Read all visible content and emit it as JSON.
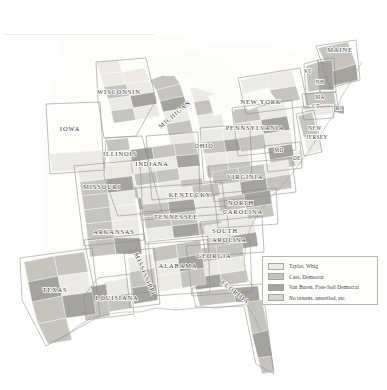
{
  "map": {
    "title": "1848 United States presidential election by county",
    "legend": {
      "items": [
        {
          "label": "Taylor, Whig",
          "color": "#eceae5"
        },
        {
          "label": "Cass, Democrat",
          "color": "#c6c4bf"
        },
        {
          "label": "Van Buren, Free-Soil Democrat",
          "color": "#a5a39e"
        },
        {
          "label": "No returns, unsettled, etc.",
          "color": "#d8d6d1"
        }
      ]
    },
    "state_labels": [
      {
        "name": "WISCONSIN",
        "x": 119,
        "y": 94,
        "size": "lbl",
        "rotate": 0
      },
      {
        "name": "IOWA",
        "x": 70,
        "y": 131,
        "size": "lbl",
        "rotate": 0
      },
      {
        "name": "ILLINOIS",
        "x": 120,
        "y": 156,
        "size": "lbl",
        "rotate": 0
      },
      {
        "name": "MICHIGAN",
        "x": 176,
        "y": 116,
        "size": "lbl",
        "rotate": -40
      },
      {
        "name": "INDIANA",
        "x": 152,
        "y": 166,
        "size": "lbl",
        "rotate": 0
      },
      {
        "name": "OHIO",
        "x": 204,
        "y": 148,
        "size": "lbl",
        "rotate": 0
      },
      {
        "name": "PENNSYLVANIA",
        "x": 255,
        "y": 130,
        "size": "lbl",
        "rotate": 0
      },
      {
        "name": "NEW YORK",
        "x": 261,
        "y": 104,
        "size": "lbl",
        "rotate": 0
      },
      {
        "name": "MAINE",
        "x": 340,
        "y": 52,
        "size": "lbl",
        "rotate": 0
      },
      {
        "name": "VT",
        "x": 308,
        "y": 73,
        "size": "lbl-sm",
        "rotate": 0
      },
      {
        "name": "NH",
        "x": 320,
        "y": 84,
        "size": "lbl-sm",
        "rotate": 0
      },
      {
        "name": "MA",
        "x": 320,
        "y": 99,
        "size": "lbl-sm",
        "rotate": 0
      },
      {
        "name": "CT",
        "x": 316,
        "y": 108,
        "size": "lbl-sm",
        "rotate": 0
      },
      {
        "name": "RI",
        "x": 339,
        "y": 110,
        "size": "lbl-sm",
        "rotate": 0
      },
      {
        "name": "NEW",
        "x": 315,
        "y": 130,
        "size": "lbl-sm",
        "rotate": 0
      },
      {
        "name": "JERSEY",
        "x": 317,
        "y": 139,
        "size": "lbl-sm",
        "rotate": 0
      },
      {
        "name": "MD",
        "x": 279,
        "y": 152,
        "size": "lbl-sm",
        "rotate": 0
      },
      {
        "name": "DE",
        "x": 297,
        "y": 160,
        "size": "lbl-sm",
        "rotate": 0
      },
      {
        "name": "VIRGINIA",
        "x": 245,
        "y": 179,
        "size": "lbl",
        "rotate": 0
      },
      {
        "name": "MISSOURI",
        "x": 102,
        "y": 189,
        "size": "lbl",
        "rotate": 0
      },
      {
        "name": "KENTUCKY",
        "x": 190,
        "y": 197,
        "size": "lbl",
        "rotate": 0
      },
      {
        "name": "TENNESSEE",
        "x": 176,
        "y": 219,
        "size": "lbl",
        "rotate": 0
      },
      {
        "name": "ARKANSAS",
        "x": 114,
        "y": 234,
        "size": "lbl",
        "rotate": 0
      },
      {
        "name": "NORTH",
        "x": 241,
        "y": 205,
        "size": "lbl",
        "rotate": 0
      },
      {
        "name": "CAROLINA",
        "x": 243,
        "y": 214,
        "size": "lbl",
        "rotate": 0
      },
      {
        "name": "SOUTH",
        "x": 225,
        "y": 233,
        "size": "lbl",
        "rotate": 0
      },
      {
        "name": "CAROLINA",
        "x": 227,
        "y": 242,
        "size": "lbl",
        "rotate": 0
      },
      {
        "name": "GEORGIA",
        "x": 214,
        "y": 258,
        "size": "lbl",
        "rotate": 0
      },
      {
        "name": "ALABAMA",
        "x": 178,
        "y": 268,
        "size": "lbl",
        "rotate": 0
      },
      {
        "name": "MISSISSIPPI",
        "x": 143,
        "y": 275,
        "size": "lbl",
        "rotate": 67
      },
      {
        "name": "LOUISIANA",
        "x": 117,
        "y": 300,
        "size": "lbl",
        "rotate": 0
      },
      {
        "name": "TEXAS",
        "x": 55,
        "y": 292,
        "size": "lbl",
        "rotate": 0
      },
      {
        "name": "FLORIDA",
        "x": 234,
        "y": 294,
        "size": "lbl",
        "rotate": 38
      }
    ]
  },
  "chart_data": {
    "type": "map",
    "projection": "albers-like",
    "legend_position": "bottom-right",
    "categories": [
      "Taylor, Whig",
      "Cass, Democrat",
      "Van Buren, Free-Soil Democrat",
      "No returns, unsettled, etc."
    ],
    "category_colors": [
      "#eceae5",
      "#c6c4bf",
      "#a5a39e",
      "#d8d6d1"
    ],
    "states_shown": [
      "WISCONSIN",
      "IOWA",
      "ILLINOIS",
      "MICHIGAN",
      "INDIANA",
      "OHIO",
      "PENNSYLVANIA",
      "NEW YORK",
      "MAINE",
      "VT",
      "NH",
      "MA",
      "CT",
      "RI",
      "NEW JERSEY",
      "MD",
      "DE",
      "VIRGINIA",
      "MISSOURI",
      "KENTUCKY",
      "TENNESSEE",
      "ARKANSAS",
      "NORTH CAROLINA",
      "SOUTH CAROLINA",
      "GEORGIA",
      "ALABAMA",
      "MISSISSIPPI",
      "LOUISIANA",
      "TEXAS",
      "FLORIDA"
    ]
  }
}
